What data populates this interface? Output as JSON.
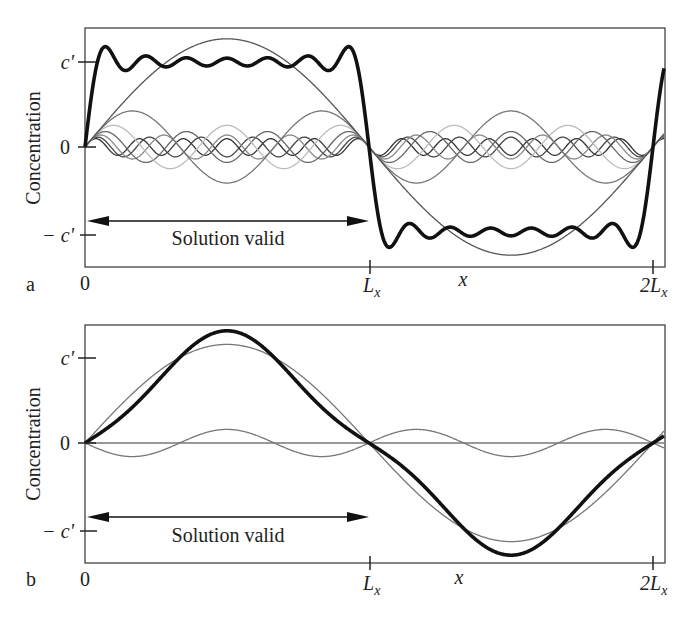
{
  "figure": {
    "panels": [
      {
        "id": "a",
        "panel_label": "a",
        "ylabel": "Concentration",
        "xlabel": "x",
        "yticks": [
          "c'",
          "0",
          "− c'"
        ],
        "xticks": [
          "0",
          "L",
          "2L"
        ],
        "xtick_sub": "x",
        "annotation": "Solution valid"
      },
      {
        "id": "b",
        "panel_label": "b",
        "ylabel": "Concentration",
        "xlabel": "x",
        "yticks": [
          "c'",
          "0",
          "− c'"
        ],
        "xticks": [
          "0",
          "L",
          "2L"
        ],
        "xtick_sub": "x",
        "annotation": "Solution valid"
      }
    ]
  },
  "chart_data": [
    {
      "type": "line",
      "panel": "a",
      "title": "",
      "xlabel": "x",
      "ylabel": "Concentration",
      "x_range": [
        "0",
        "2L_x"
      ],
      "xtick_labels": [
        "0",
        "L_x",
        "2L_x"
      ],
      "ytick_labels": [
        "-c'",
        "0",
        "c'"
      ],
      "ylim": [
        -1.35,
        1.45
      ],
      "grid": false,
      "legend": null,
      "annotations": [
        {
          "text": "Solution valid",
          "arrow_from": "0",
          "arrow_to": "L_x"
        }
      ],
      "description": "Fourier sine-series approximation of a square wave (c' on 0..L_x, -c' on L_x..2L_x); thin curves are individual odd harmonics, thick curve is their sum showing Gibbs ringing",
      "series": [
        {
          "name": "n=1",
          "amplitude": 1.273,
          "harmonic": 1,
          "style": "thin",
          "color": "#555555"
        },
        {
          "name": "n=3",
          "amplitude": 0.424,
          "harmonic": 3,
          "style": "thin",
          "color": "#777777"
        },
        {
          "name": "n=5",
          "amplitude": 0.255,
          "harmonic": 5,
          "style": "thin",
          "color": "#bbbbbb"
        },
        {
          "name": "n=7",
          "amplitude": 0.182,
          "harmonic": 7,
          "style": "thin",
          "color": "#666666"
        },
        {
          "name": "n=9",
          "amplitude": 0.141,
          "harmonic": 9,
          "style": "thin",
          "color": "#888888"
        },
        {
          "name": "n=11",
          "amplitude": 0.116,
          "harmonic": 11,
          "style": "thin",
          "color": "#444444"
        },
        {
          "name": "n=13",
          "amplitude": 0.098,
          "harmonic": 13,
          "style": "thin",
          "color": "#333333"
        },
        {
          "name": "sum",
          "style": "thick",
          "color": "#111111",
          "harmonics": [
            1,
            3,
            5,
            7,
            9,
            11,
            13
          ]
        }
      ]
    },
    {
      "type": "line",
      "panel": "b",
      "title": "",
      "xlabel": "x",
      "ylabel": "Concentration",
      "x_range": [
        "0",
        "2L_x"
      ],
      "xtick_labels": [
        "0",
        "L_x",
        "2L_x"
      ],
      "ytick_labels": [
        "-c'",
        "0",
        "c'"
      ],
      "ylim": [
        -1.35,
        1.45
      ],
      "grid": false,
      "legend": null,
      "annotations": [
        {
          "text": "Solution valid",
          "arrow_from": "0",
          "arrow_to": "L_x"
        }
      ],
      "description": "Smoothed concentration profile: thin curves are first and third harmonic terms, thick curve is their sum (flat-topped)",
      "series": [
        {
          "name": "n=1",
          "amplitude": 1.16,
          "harmonic": 1,
          "style": "thin",
          "color": "#777777"
        },
        {
          "name": "n=3",
          "amplitude": 0.16,
          "harmonic": 3,
          "style": "thin",
          "color": "#777777"
        },
        {
          "name": "zero line",
          "amplitude": 0.0,
          "harmonic": 0,
          "style": "thin",
          "color": "#777777"
        },
        {
          "name": "sum",
          "style": "thick",
          "color": "#111111",
          "terms": [
            [
              1,
              1.16
            ],
            [
              3,
              0.16
            ]
          ]
        }
      ]
    }
  ]
}
